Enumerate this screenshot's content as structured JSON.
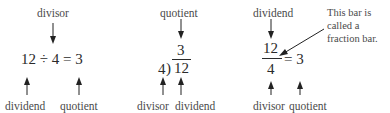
{
  "panel_1": {
    "top_label": "divisor",
    "equation": "12 ÷ 4 = 3",
    "bottom_labels": [
      "dividend",
      "quotient"
    ]
  },
  "panel_2": {
    "top_label": "quotient",
    "quotient": "3",
    "divisor": "4",
    "bracket": ")",
    "dividend": "12",
    "bottom_labels": [
      "divisor",
      "dividend"
    ]
  },
  "panel_3": {
    "top_label": "dividend",
    "numerator": "12",
    "denominator": "4",
    "equals_result": "= 3",
    "bottom_labels": [
      "divisor",
      "quotient"
    ],
    "callout": [
      "This bar is",
      "called a",
      "fraction bar."
    ]
  },
  "colors": {
    "text": "#333333",
    "arrow": "#222222"
  }
}
